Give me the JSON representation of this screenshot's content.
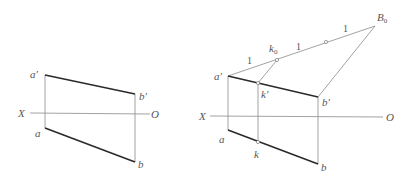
{
  "left_figure": {
    "labels": {
      "a_prime": "a′",
      "b_prime": "b′",
      "a": "a",
      "b": "b",
      "X": "X",
      "O": "O"
    }
  },
  "right_figure": {
    "labels": {
      "a_prime": "a′",
      "b_prime": "b′",
      "k_prime": "k′",
      "a": "a",
      "b": "b",
      "k": "k",
      "X": "X",
      "O": "O",
      "k0_main": "k",
      "k0_sub": "0",
      "B0_main": "B",
      "B0_sub": "0",
      "segment_1a": "1",
      "segment_1b": "1",
      "segment_1c": "1"
    }
  },
  "colors": {
    "thick_line": "#2a2a2a",
    "thin_line": "#8a8a8a",
    "label": "#555555"
  }
}
